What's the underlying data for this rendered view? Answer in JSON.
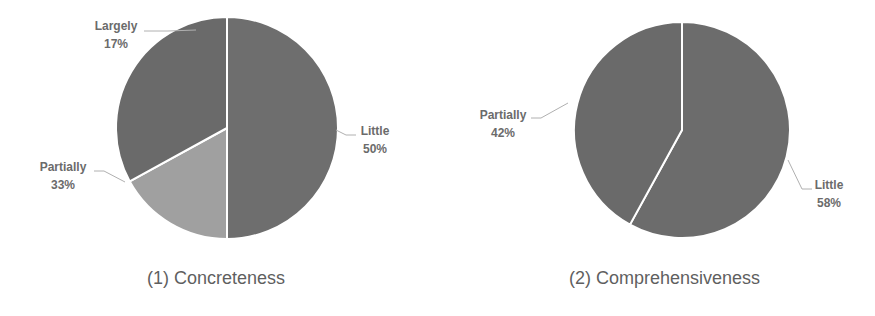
{
  "chart_data": [
    {
      "type": "pie",
      "title": "(1) Concreteness",
      "categories": [
        "Little",
        "Largely",
        "Partially"
      ],
      "values": [
        50,
        17,
        33
      ],
      "labels": [
        "Little\n50%",
        "Largely\n17%",
        "Partially\n33%"
      ],
      "colors": [
        "#6e6e6e",
        "#a0a0a0",
        "#6a6a6a"
      ],
      "start_angle_deg": 0,
      "direction": "clockwise",
      "legend": "none",
      "data_labels": "category name and percentage, outside with leader lines"
    },
    {
      "type": "pie",
      "title": "(2) Comprehensiveness",
      "categories": [
        "Little",
        "Partially"
      ],
      "values": [
        58,
        42
      ],
      "labels": [
        "Little\n58%",
        "Partially\n42%"
      ],
      "colors": [
        "#6c6c6c",
        "#6a6a6a"
      ],
      "start_angle_deg": 0,
      "direction": "clockwise",
      "legend": "none",
      "data_labels": "category name and percentage, outside with leader lines"
    }
  ],
  "charts": [
    {
      "caption": "(1) Concreteness",
      "slices": [
        {
          "name": "Little",
          "pct": "50%"
        },
        {
          "name": "Largely",
          "pct": "17%"
        },
        {
          "name": "Partially",
          "pct": "33%"
        }
      ]
    },
    {
      "caption": "(2) Comprehensiveness",
      "slices": [
        {
          "name": "Little",
          "pct": "58%"
        },
        {
          "name": "Partially",
          "pct": "42%"
        }
      ]
    }
  ]
}
